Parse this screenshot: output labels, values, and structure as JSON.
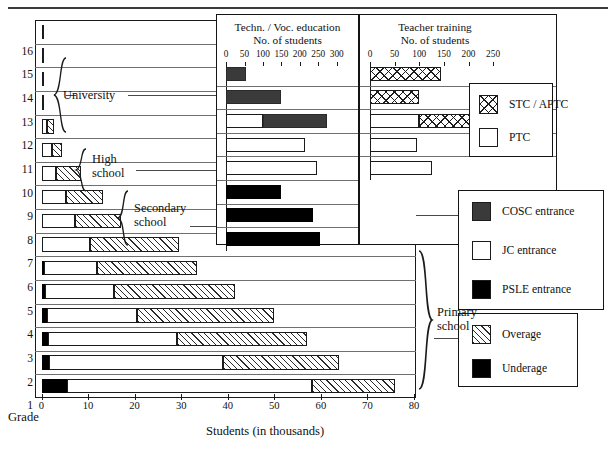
{
  "figure": {
    "x_axis_caption": "Students (in thousands)",
    "grade_caption": "Grade"
  },
  "panels": {
    "tech": {
      "title_line1": "Techn. / Voc. education",
      "title_line2": "No. of students"
    },
    "teacher": {
      "title_line1": "Teacher training",
      "title_line2": "No. of students"
    }
  },
  "groups": [
    {
      "label_line1": "University",
      "label_line2": ""
    },
    {
      "label_line1": "High",
      "label_line2": "school"
    },
    {
      "label_line1": "Secondary",
      "label_line2": "school"
    },
    {
      "label_line1": "Primary",
      "label_line2": "school"
    }
  ],
  "legends": {
    "teacher_training": {
      "items": [
        {
          "label": "STC / APTC",
          "pattern": "crosshatch"
        },
        {
          "label": "PTC",
          "pattern": "white"
        }
      ]
    },
    "entrance": {
      "items": [
        {
          "label": "COSC entrance",
          "pattern": "dark-gray",
          "color": "#3a3a3a"
        },
        {
          "label": "JC entrance",
          "pattern": "white",
          "color": "#ffffff"
        },
        {
          "label": "PSLE entrance",
          "pattern": "black",
          "color": "#000000"
        }
      ]
    },
    "age": {
      "items": [
        {
          "label": "Overage",
          "pattern": "diagonal-hatch"
        },
        {
          "label": "Underage",
          "pattern": "black",
          "color": "#000000"
        }
      ]
    }
  },
  "chart_data": [
    {
      "type": "bar",
      "id": "main-enrolment",
      "orientation": "horizontal",
      "stacked": true,
      "title": "",
      "xlabel": "Students (in thousands)",
      "ylabel": "Grade",
      "xlim": [
        0,
        80
      ],
      "xticks": [
        0,
        10,
        20,
        30,
        40,
        50,
        60,
        70,
        80
      ],
      "xticklabels": [
        "0",
        "10",
        "20",
        "30",
        "40",
        "50",
        "60",
        "70",
        "80"
      ],
      "grid": true,
      "categories": [
        "1",
        "2",
        "3",
        "4",
        "5",
        "6",
        "7",
        "8",
        "9",
        "10",
        "11",
        "12",
        "13",
        "14",
        "15",
        "16"
      ],
      "series": [
        {
          "name": "Underage",
          "pattern": "black",
          "values": [
            5.5,
            1.6,
            1.4,
            1.2,
            0.8,
            0.5,
            0.0,
            0.0,
            0.0,
            0.0,
            0.0,
            0.0,
            0.0,
            0.0,
            0.0,
            0.0
          ]
        },
        {
          "name": "Normal age",
          "pattern": "white",
          "values": [
            52.5,
            37.4,
            27.6,
            19.4,
            14.7,
            11.5,
            10.5,
            7.2,
            5.3,
            3.2,
            2.2,
            1.2,
            0.45,
            0.45,
            0.45,
            0.3
          ]
        },
        {
          "name": "Overage",
          "pattern": "diagonal-hatch",
          "values": [
            18.0,
            25.0,
            28.0,
            29.4,
            26.0,
            21.5,
            19.0,
            9.8,
            8.0,
            5.4,
            2.3,
            1.6,
            0.0,
            0.0,
            0.0,
            0.0
          ]
        }
      ],
      "row_totals": [
        76.0,
        64.0,
        57.0,
        50.0,
        41.5,
        33.5,
        29.5,
        17.0,
        13.3,
        8.6,
        4.5,
        2.8,
        0.45,
        0.45,
        0.45,
        0.3
      ]
    },
    {
      "type": "bar",
      "id": "technical-vocational",
      "orientation": "horizontal",
      "stacked": true,
      "title": "Techn. / Voc. education  No. of students",
      "xlabel": "No. of students",
      "xlim": [
        0,
        325
      ],
      "xticks": [
        0,
        50,
        100,
        150,
        200,
        250,
        300
      ],
      "xticklabels": [
        "0",
        "50",
        "100",
        "150",
        "200",
        "250",
        "300"
      ],
      "grid": true,
      "categories": [
        "15",
        "14",
        "13",
        "12",
        "11",
        "10",
        "9",
        "8"
      ],
      "series": [
        {
          "name": "JC entrance",
          "pattern": "white",
          "values": [
            0,
            0,
            100,
            215,
            245,
            0,
            0,
            0
          ]
        },
        {
          "name": "COSC entrance",
          "pattern": "dark-gray",
          "values": [
            55,
            150,
            175,
            0,
            0,
            0,
            0,
            0
          ]
        },
        {
          "name": "PSLE entrance",
          "pattern": "black",
          "values": [
            0,
            0,
            0,
            0,
            0,
            150,
            235,
            255
          ]
        }
      ]
    },
    {
      "type": "bar",
      "id": "teacher-training",
      "orientation": "horizontal",
      "stacked": true,
      "title": "Teacher training  No. of students",
      "xlabel": "No. of students",
      "xlim": [
        0,
        270
      ],
      "xticks": [
        0,
        50,
        100,
        150,
        200,
        250
      ],
      "xticklabels": [
        "0",
        "50",
        "100",
        "150",
        "200",
        "250"
      ],
      "grid": true,
      "categories": [
        "15",
        "14",
        "13",
        "12",
        "11"
      ],
      "series": [
        {
          "name": "PTC",
          "pattern": "white",
          "values": [
            0,
            0,
            100,
            95,
            125
          ]
        },
        {
          "name": "STC / APTC",
          "pattern": "crosshatch",
          "values": [
            145,
            100,
            105,
            0,
            0
          ]
        }
      ]
    }
  ]
}
